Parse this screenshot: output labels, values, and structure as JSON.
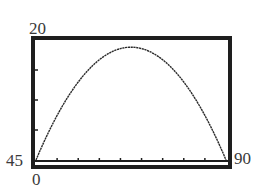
{
  "chart_data": {
    "type": "line",
    "title": "",
    "xlabel": "",
    "ylabel": "",
    "window": {
      "xmin": 0,
      "xmax": 90,
      "ymin": 0,
      "ymax": 20,
      "xscale": 10
    },
    "corner_labels": {
      "ymax_label": "20",
      "left_bottom_label": "45",
      "xmin_label": "0",
      "xmax_label": "90"
    },
    "series": [
      {
        "name": "curve",
        "shape": "downward parabola",
        "x": [
          0,
          10,
          20,
          30,
          40,
          45,
          50,
          60,
          70,
          80,
          90
        ],
        "values": [
          0,
          7.4,
          13.0,
          16.7,
          18.5,
          18.8,
          18.5,
          16.7,
          13.0,
          7.4,
          0
        ]
      }
    ],
    "x_ticks": [
      10,
      20,
      30,
      40,
      50,
      60,
      70,
      80
    ],
    "y_ticks": [
      5,
      10,
      15
    ],
    "grid": false,
    "legend": false
  },
  "colors": {
    "frame": "#1e1e1e",
    "curve": "#2a2a2a",
    "labels": "#3a3a3a",
    "background": "#ffffff"
  }
}
